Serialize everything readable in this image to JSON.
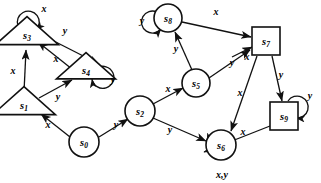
{
  "diagram": {
    "colors": {
      "stroke": "#111111",
      "fill": "#ffffff",
      "text": "#000000"
    },
    "alphabet": [
      "x",
      "y"
    ],
    "nodes": [
      {
        "id": "s0",
        "label": "s",
        "sub": "0",
        "shape": "circle",
        "x": 84,
        "y": 142,
        "r": 15
      },
      {
        "id": "s1",
        "label": "s",
        "sub": "1",
        "shape": "triangle",
        "x": 24,
        "y": 103,
        "r": 17
      },
      {
        "id": "s2",
        "label": "s",
        "sub": "2",
        "shape": "circle",
        "x": 140,
        "y": 111,
        "r": 15
      },
      {
        "id": "s3",
        "label": "s",
        "sub": "3",
        "shape": "triangle",
        "x": 27,
        "y": 33,
        "r": 17
      },
      {
        "id": "s4",
        "label": "s",
        "sub": "4",
        "shape": "triangle",
        "x": 86,
        "y": 68,
        "r": 16
      },
      {
        "id": "s5",
        "label": "s",
        "sub": "5",
        "shape": "circle",
        "x": 196,
        "y": 83,
        "r": 14
      },
      {
        "id": "s6",
        "label": "s",
        "sub": "6",
        "shape": "circle",
        "x": 221,
        "y": 145,
        "r": 15
      },
      {
        "id": "s7",
        "label": "s",
        "sub": "7",
        "shape": "square",
        "x": 266,
        "y": 41,
        "r": 14
      },
      {
        "id": "s8",
        "label": "s",
        "sub": "8",
        "shape": "circle",
        "x": 168,
        "y": 18,
        "r": 14
      },
      {
        "id": "s9",
        "label": "s",
        "sub": "9",
        "shape": "square",
        "x": 284,
        "y": 116,
        "r": 14
      }
    ],
    "edges": [
      {
        "id": "e-s0-s1",
        "from": "s0",
        "to": "s1",
        "label": "x"
      },
      {
        "id": "e-s0-s2",
        "from": "s0",
        "to": "s2",
        "label": "y"
      },
      {
        "id": "e-s1-s3",
        "from": "s1",
        "to": "s3",
        "label": "x"
      },
      {
        "id": "e-s1-s4",
        "from": "s1",
        "to": "s4",
        "label": "y"
      },
      {
        "id": "e-s3-s4",
        "from": "s3",
        "to": "s4",
        "label": "y"
      },
      {
        "id": "e-s4-s3",
        "from": "s4",
        "to": "s3",
        "label": "x"
      },
      {
        "id": "e-s2-s5",
        "from": "s2",
        "to": "s5",
        "label": "x"
      },
      {
        "id": "e-s2-s6",
        "from": "s2",
        "to": "s6",
        "label": "y"
      },
      {
        "id": "e-s5-s8",
        "from": "s5",
        "to": "s8",
        "label": "y"
      },
      {
        "id": "e-s5-s7",
        "from": "s5",
        "to": "s7",
        "label": "y"
      },
      {
        "id": "e-s8-s7",
        "from": "s8",
        "to": "s7",
        "label": "x"
      },
      {
        "id": "e-s7-s9",
        "from": "s7",
        "to": "s9",
        "label": "y"
      },
      {
        "id": "e-s7-s6",
        "from": "s7",
        "to": "s6",
        "label": "x"
      },
      {
        "id": "e-s6-s7",
        "from": "s6",
        "to": "s7",
        "label": "x"
      },
      {
        "id": "e-s9-s6",
        "from": "s9",
        "to": "s6",
        "label": "x"
      }
    ],
    "self_loops": [
      {
        "id": "loop-s3",
        "node": "s3",
        "label": "x",
        "side": "top"
      },
      {
        "id": "loop-s4",
        "node": "s4",
        "label": "y",
        "side": "right"
      },
      {
        "id": "loop-s8",
        "node": "s8",
        "label": "y",
        "side": "left"
      },
      {
        "id": "loop-s9",
        "node": "s9",
        "label": "y",
        "side": "right"
      },
      {
        "id": "loop-s6",
        "node": "s6",
        "label": "x,y",
        "side": "bottom"
      }
    ]
  }
}
